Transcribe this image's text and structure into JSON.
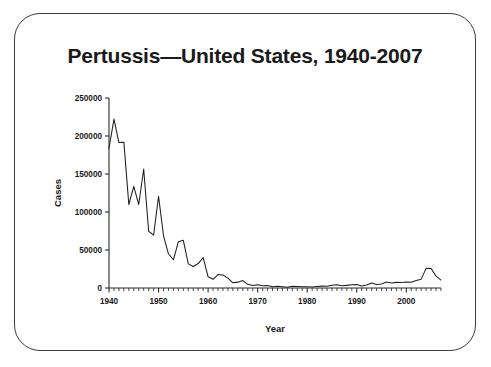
{
  "slide": {
    "title": "Pertussis—United States, 1940-2007"
  },
  "chart_data": {
    "type": "line",
    "title": "Pertussis—United States, 1940-2007",
    "xlabel": "Year",
    "ylabel": "Cases",
    "xlim": [
      1940,
      2007
    ],
    "ylim": [
      0,
      250000
    ],
    "grid": false,
    "legend": null,
    "y_ticks": [
      0,
      50000,
      100000,
      150000,
      200000,
      250000
    ],
    "y_tick_labels": [
      "0",
      "50000",
      "100000",
      "150000",
      "200000",
      "250000"
    ],
    "x_ticks": [
      1940,
      1950,
      1960,
      1970,
      1980,
      1990,
      2000
    ],
    "x_tick_labels": [
      "1940",
      "1950",
      "1960",
      "1970",
      "1980",
      "1990",
      "2000"
    ],
    "x_minor_tick_step": 1,
    "line_color": "#1f1f1f",
    "x": [
      1940,
      1941,
      1942,
      1943,
      1944,
      1945,
      1946,
      1947,
      1948,
      1949,
      1950,
      1951,
      1952,
      1953,
      1954,
      1955,
      1956,
      1957,
      1958,
      1959,
      1960,
      1961,
      1962,
      1963,
      1964,
      1965,
      1966,
      1967,
      1968,
      1969,
      1970,
      1971,
      1972,
      1973,
      1974,
      1975,
      1976,
      1977,
      1978,
      1979,
      1980,
      1981,
      1982,
      1983,
      1984,
      1985,
      1986,
      1987,
      1988,
      1989,
      1990,
      1991,
      1992,
      1993,
      1994,
      1995,
      1996,
      1997,
      1998,
      1999,
      2000,
      2001,
      2002,
      2003,
      2004,
      2005,
      2006,
      2007
    ],
    "values": [
      183866,
      222202,
      191383,
      191890,
      109873,
      133792,
      109860,
      156517,
      74715,
      69479,
      120718,
      68687,
      45030,
      37129,
      60886,
      62786,
      31732,
      28295,
      32148,
      40005,
      14809,
      11468,
      17749,
      17135,
      13005,
      6799,
      7717,
      9718,
      4810,
      3285,
      4249,
      3036,
      3287,
      1759,
      2402,
      1738,
      1010,
      2177,
      2063,
      1623,
      1730,
      1248,
      1895,
      2463,
      2276,
      3589,
      4195,
      2823,
      3450,
      4157,
      4570,
      2719,
      4083,
      6586,
      4617,
      5137,
      7796,
      6564,
      7405,
      7298,
      7867,
      7580,
      9771,
      11647,
      25827,
      25616,
      15632,
      10454
    ],
    "notes": {
      "peak_year": 1941,
      "peak_value": 222202,
      "recent_resurgence_peak_year": 2004,
      "recent_resurgence_peak_value": 25827
    }
  }
}
